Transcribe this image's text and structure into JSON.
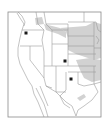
{
  "map": {
    "type": "species-range-map",
    "region": "Western and Central United States",
    "colors": {
      "background": "#ffffff",
      "frame": "#8a8a8a",
      "borders": "#9a9a9a",
      "range_fill": "#d2d2d2",
      "marker": "#1a1a1a"
    },
    "range_areas": [
      {
        "name": "northern-plains-range",
        "label": "Northern Plains range"
      },
      {
        "name": "kansas-oklahoma-range",
        "label": "Kansas / Oklahoma range"
      },
      {
        "name": "montana-strip-range",
        "label": "Montana strip range"
      },
      {
        "name": "washington-range",
        "label": "Northern Washington range"
      },
      {
        "name": "texas-patch-range",
        "label": "Central Texas patch"
      }
    ],
    "markers": [
      {
        "name": "marker-washington",
        "x": 26,
        "y": 33
      },
      {
        "name": "marker-colorado",
        "x": 65,
        "y": 61
      },
      {
        "name": "marker-oklahoma",
        "x": 71,
        "y": 79
      }
    ]
  }
}
